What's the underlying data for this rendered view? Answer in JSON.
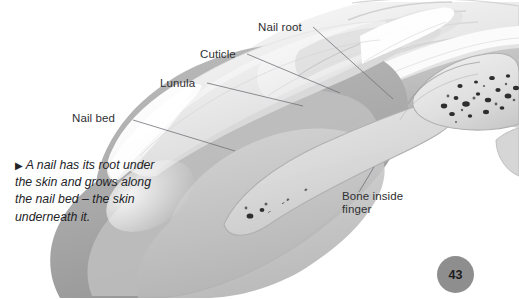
{
  "page": {
    "number": "43",
    "background_color": "#ffffff",
    "page_number_circle_color": "#8e8e8e"
  },
  "illustration": {
    "name": "fingertip-cross-section",
    "description": "Greyscale cut-away illustration of a human fingertip showing the nail, nail bed, cuticle, lunula, nail root and the bone inside the finger",
    "palette": {
      "skin_light": "#e9e9e9",
      "skin_mid": "#c9c9c9",
      "skin_dark": "#a8a8a8",
      "nail_plate": "#f2f2f2",
      "nail_edge": "#ffffff",
      "bone_fill": "#d6d6d6",
      "marrow_speckle": "#3a3a3a",
      "outline": "#8a8a8a"
    }
  },
  "labels": [
    {
      "id": "nail-root",
      "text": "Nail root"
    },
    {
      "id": "cuticle",
      "text": "Cuticle"
    },
    {
      "id": "lunula",
      "text": "Lunula"
    },
    {
      "id": "nail-bed",
      "text": "Nail bed"
    },
    {
      "id": "bone-inside-finger",
      "text": "Bone inside finger"
    }
  ],
  "caption": {
    "marker": "▶",
    "text": "A nail has its root under the skin and grows along the nail bed – the skin underneath it."
  }
}
